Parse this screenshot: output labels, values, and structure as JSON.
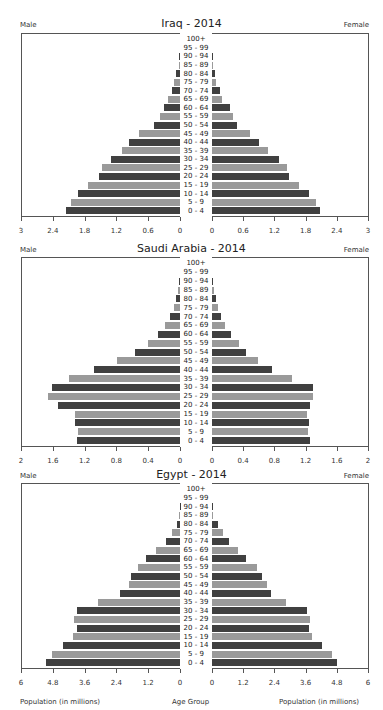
{
  "chart_data": [
    {
      "type": "bar",
      "orientation": "horizontal",
      "title": "Iraq - 2014",
      "left_label": "Male",
      "right_label": "Female",
      "categories": [
        "0 - 4",
        "5 - 9",
        "10 - 14",
        "15 - 19",
        "20 - 24",
        "25 - 29",
        "30 - 34",
        "35 - 39",
        "40 - 44",
        "45 - 49",
        "50 - 54",
        "55 - 59",
        "60 - 64",
        "65 - 69",
        "70 - 74",
        "75 - 79",
        "80 - 84",
        "85 - 89",
        "90 - 94",
        "95 - 99",
        "100+"
      ],
      "series": [
        {
          "name": "Male",
          "values": [
            2.15,
            2.06,
            1.92,
            1.73,
            1.53,
            1.48,
            1.31,
            1.1,
            0.96,
            0.77,
            0.5,
            0.37,
            0.3,
            0.22,
            0.16,
            0.12,
            0.07,
            0.02,
            0.01,
            0.0,
            0.0
          ]
        },
        {
          "name": "Female",
          "values": [
            2.07,
            2.0,
            1.86,
            1.68,
            1.49,
            1.45,
            1.28,
            1.07,
            0.9,
            0.73,
            0.49,
            0.41,
            0.35,
            0.19,
            0.16,
            0.08,
            0.06,
            0.02,
            0.01,
            0.0,
            0.0
          ]
        }
      ],
      "xlim": [
        0,
        3
      ],
      "ticks": [
        "3",
        "2.4",
        "1.8",
        "1.2",
        "0.6",
        "0"
      ],
      "tick_values": [
        3,
        2.4,
        1.8,
        1.2,
        0.6,
        0
      ]
    },
    {
      "type": "bar",
      "orientation": "horizontal",
      "title": "Saudi Arabia - 2014",
      "left_label": "Male",
      "right_label": "Female",
      "categories": [
        "0 - 4",
        "5 - 9",
        "10 - 14",
        "15 - 19",
        "20 - 24",
        "25 - 29",
        "30 - 34",
        "35 - 39",
        "40 - 44",
        "45 - 49",
        "50 - 54",
        "55 - 59",
        "60 - 64",
        "65 - 69",
        "70 - 74",
        "75 - 79",
        "80 - 84",
        "85 - 89",
        "90 - 94",
        "95 - 99",
        "100+"
      ],
      "series": [
        {
          "name": "Male",
          "values": [
            1.3,
            1.28,
            1.32,
            1.32,
            1.53,
            1.66,
            1.61,
            1.4,
            1.08,
            0.79,
            0.57,
            0.4,
            0.28,
            0.19,
            0.13,
            0.08,
            0.05,
            0.02,
            0.01,
            0.0,
            0.0
          ]
        },
        {
          "name": "Female",
          "values": [
            1.25,
            1.23,
            1.24,
            1.22,
            1.26,
            1.29,
            1.29,
            1.03,
            0.77,
            0.59,
            0.44,
            0.34,
            0.24,
            0.17,
            0.12,
            0.08,
            0.05,
            0.02,
            0.01,
            0.0,
            0.0
          ]
        }
      ],
      "xlim": [
        0,
        2
      ],
      "ticks": [
        "2",
        "1.6",
        "1.2",
        "0.8",
        "0.4",
        "0"
      ],
      "tick_values": [
        2,
        1.6,
        1.2,
        0.8,
        0.4,
        0
      ]
    },
    {
      "type": "bar",
      "orientation": "horizontal",
      "title": "Egypt - 2014",
      "left_label": "Male",
      "right_label": "Female",
      "categories": [
        "0 - 4",
        "5 - 9",
        "10 - 14",
        "15 - 19",
        "20 - 24",
        "25 - 29",
        "30 - 34",
        "35 - 39",
        "40 - 44",
        "45 - 49",
        "50 - 54",
        "55 - 59",
        "60 - 64",
        "65 - 69",
        "70 - 74",
        "75 - 79",
        "80 - 84",
        "85 - 89",
        "90 - 94",
        "95 - 99",
        "100+"
      ],
      "series": [
        {
          "name": "Male",
          "values": [
            5.04,
            4.84,
            4.43,
            4.04,
            3.9,
            3.99,
            3.88,
            3.09,
            2.25,
            1.94,
            1.86,
            1.6,
            1.3,
            0.91,
            0.53,
            0.29,
            0.13,
            0.02,
            0.01,
            0.0,
            0.0
          ]
        },
        {
          "name": "Female",
          "values": [
            4.81,
            4.62,
            4.23,
            3.86,
            3.72,
            3.75,
            3.65,
            2.84,
            2.28,
            2.12,
            1.94,
            1.73,
            1.32,
            1.0,
            0.67,
            0.42,
            0.24,
            0.05,
            0.01,
            0.0,
            0.0
          ]
        }
      ],
      "xlim": [
        0,
        6
      ],
      "ticks": [
        "6",
        "4.8",
        "3.6",
        "2.4",
        "1.2",
        "0"
      ],
      "tick_values": [
        6,
        4.8,
        3.6,
        2.4,
        1.2,
        0
      ]
    }
  ],
  "axis_labels": {
    "left_x": "Population (in millions)",
    "center": "Age Group",
    "right_x": "Population (in millions)"
  },
  "colors": {
    "dark_bar": "#404040",
    "light_bar": "#9a9a9a",
    "axis": "#555555"
  }
}
